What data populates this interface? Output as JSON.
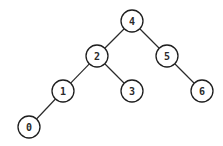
{
  "diagram": {
    "type": "binary-tree",
    "node_radius": 11,
    "colors": {
      "background": "#ffffff",
      "stroke": "#1e1e1e",
      "edge": "#2a2a2a",
      "text": "#2a2a2a"
    },
    "nodes": [
      {
        "id": "n4",
        "label": "4",
        "x": 132,
        "y": 21
      },
      {
        "id": "n2",
        "label": "2",
        "x": 97,
        "y": 56
      },
      {
        "id": "n5",
        "label": "5",
        "x": 167,
        "y": 56
      },
      {
        "id": "n1",
        "label": "1",
        "x": 63,
        "y": 91
      },
      {
        "id": "n3",
        "label": "3",
        "x": 132,
        "y": 91
      },
      {
        "id": "n6",
        "label": "6",
        "x": 202,
        "y": 91
      },
      {
        "id": "n0",
        "label": "0",
        "x": 29,
        "y": 127
      }
    ],
    "edges": [
      {
        "from": "n4",
        "to": "n2"
      },
      {
        "from": "n4",
        "to": "n5"
      },
      {
        "from": "n2",
        "to": "n1"
      },
      {
        "from": "n2",
        "to": "n3"
      },
      {
        "from": "n5",
        "to": "n6"
      },
      {
        "from": "n1",
        "to": "n0"
      }
    ]
  }
}
